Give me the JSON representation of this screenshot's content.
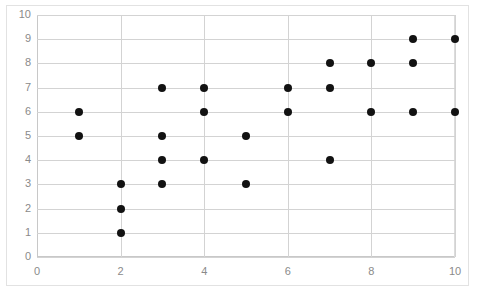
{
  "chart_data": {
    "type": "scatter",
    "title": "",
    "subtitle": "",
    "xlabel": "",
    "ylabel": "",
    "xlim": [
      0,
      10
    ],
    "ylim": [
      0,
      10
    ],
    "xticks": [
      0,
      2,
      4,
      6,
      8,
      10
    ],
    "yticks": [
      0,
      1,
      2,
      3,
      4,
      5,
      6,
      7,
      8,
      9,
      10
    ],
    "grid": {
      "horizontal": true,
      "vertical": true,
      "color": "#d3d3d3"
    },
    "legend": {
      "visible": false,
      "position": "none",
      "entries": []
    },
    "series": [
      {
        "name": "",
        "marker": "circle",
        "color": "#121212",
        "points": [
          {
            "x": 1,
            "y": 6
          },
          {
            "x": 1,
            "y": 5
          },
          {
            "x": 2,
            "y": 3
          },
          {
            "x": 2,
            "y": 2
          },
          {
            "x": 2,
            "y": 1
          },
          {
            "x": 3,
            "y": 7
          },
          {
            "x": 3,
            "y": 5
          },
          {
            "x": 3,
            "y": 4
          },
          {
            "x": 3,
            "y": 3
          },
          {
            "x": 4,
            "y": 7
          },
          {
            "x": 4,
            "y": 6
          },
          {
            "x": 4,
            "y": 4
          },
          {
            "x": 5,
            "y": 5
          },
          {
            "x": 5,
            "y": 3
          },
          {
            "x": 6,
            "y": 7
          },
          {
            "x": 6,
            "y": 6
          },
          {
            "x": 7,
            "y": 8
          },
          {
            "x": 7,
            "y": 7
          },
          {
            "x": 7,
            "y": 4
          },
          {
            "x": 8,
            "y": 8
          },
          {
            "x": 8,
            "y": 6
          },
          {
            "x": 9,
            "y": 9
          },
          {
            "x": 9,
            "y": 8
          },
          {
            "x": 9,
            "y": 6
          },
          {
            "x": 10,
            "y": 9
          },
          {
            "x": 10,
            "y": 6
          }
        ]
      }
    ]
  },
  "style": {
    "plot_background": "#ffffff",
    "frame_border": "#e2e2e2",
    "tick_label_color": "#8a8a8a",
    "axis_color": "#c8c8c8",
    "marker_color": "#121212"
  }
}
